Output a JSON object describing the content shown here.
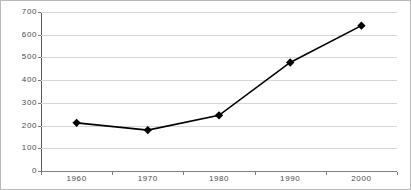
{
  "chart_data": {
    "type": "line",
    "title": "",
    "xlabel": "",
    "ylabel": "",
    "categories": [
      "1960",
      "1970",
      "1980",
      "1990",
      "2000"
    ],
    "values": [
      212,
      180,
      245,
      478,
      640
    ],
    "series": [
      {
        "name": "",
        "values": [
          212,
          180,
          245,
          478,
          640
        ]
      }
    ],
    "ylim": [
      0,
      700
    ],
    "y_ticks": [
      "0",
      "100",
      "200",
      "300",
      "400",
      "500",
      "600",
      "700"
    ],
    "y_tick_values": [
      0,
      100,
      200,
      300,
      400,
      500,
      600,
      700
    ],
    "grid": true,
    "legend": "none",
    "marker": "diamond",
    "colors": {
      "line": "#000000",
      "marker": "#000000",
      "gridline": "#d6d6d6",
      "axis": "#5a5a5a",
      "frame": "#b9b9b9",
      "tick_label": "#4a4a4a",
      "background": "#ffffff"
    }
  }
}
